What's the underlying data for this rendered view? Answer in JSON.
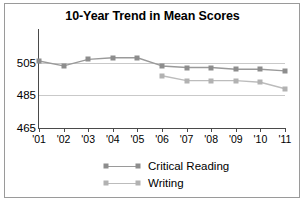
{
  "chart_data": {
    "type": "line",
    "title": "10-Year Trend in Mean Scores",
    "xlabel": "",
    "ylabel": "",
    "x": [
      "'01",
      "'02",
      "'03",
      "'04",
      "'05",
      "'06",
      "'07",
      "'08",
      "'09",
      "'10",
      "'11"
    ],
    "ylim": [
      465,
      525
    ],
    "yticks": [
      465,
      485,
      505
    ],
    "ytick_labels": [
      "465",
      "485",
      "505"
    ],
    "grid": true,
    "legend_position": "bottom",
    "series": [
      {
        "name": "Critical Reading",
        "color": "#8d8d8d",
        "values": [
          506,
          503,
          507,
          508,
          508,
          503,
          502,
          502,
          501,
          501,
          500
        ]
      },
      {
        "name": "Writing",
        "color": "#b2b2b2",
        "values": [
          null,
          null,
          null,
          null,
          null,
          497,
          494,
          494,
          494,
          493,
          489
        ]
      }
    ]
  },
  "legend": {
    "items": [
      {
        "label": "Critical Reading"
      },
      {
        "label": "Writing"
      }
    ]
  }
}
